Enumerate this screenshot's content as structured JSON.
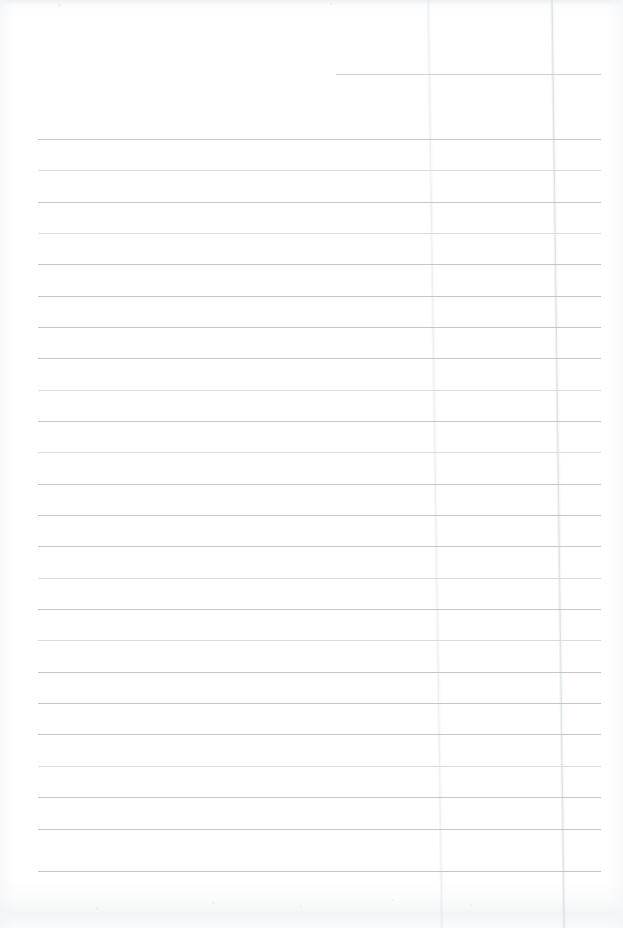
{
  "document": {
    "kind": "scanned-page",
    "description": "Blank ruled notebook page scan",
    "page_width": 623,
    "page_height": 928,
    "background_color": "#ffffff",
    "rule_color": "#b9bdc2",
    "rule_color_faint": "#d6d9dd",
    "crease_color": "#d4d9df",
    "text_content": "",
    "ruling": {
      "line_count": 24,
      "first_line_y": 139,
      "line_spacing": 31.3,
      "left_margin_x": 38,
      "right_margin_x": 600
    },
    "partial_line": {
      "y": 74,
      "x_start": 336,
      "x_end": 601
    },
    "lines": [
      {
        "y": 139,
        "x": 38,
        "width": 563,
        "faint": false
      },
      {
        "y": 170,
        "x": 38,
        "width": 563,
        "faint": true
      },
      {
        "y": 202,
        "x": 38,
        "width": 563,
        "faint": false
      },
      {
        "y": 233,
        "x": 38,
        "width": 563,
        "faint": true
      },
      {
        "y": 264,
        "x": 38,
        "width": 563,
        "faint": false
      },
      {
        "y": 296,
        "x": 38,
        "width": 563,
        "faint": false
      },
      {
        "y": 327,
        "x": 38,
        "width": 563,
        "faint": false
      },
      {
        "y": 358,
        "x": 38,
        "width": 563,
        "faint": false
      },
      {
        "y": 390,
        "x": 38,
        "width": 563,
        "faint": true
      },
      {
        "y": 421,
        "x": 38,
        "width": 563,
        "faint": false
      },
      {
        "y": 452,
        "x": 38,
        "width": 563,
        "faint": true
      },
      {
        "y": 484,
        "x": 38,
        "width": 563,
        "faint": false
      },
      {
        "y": 515,
        "x": 38,
        "width": 563,
        "faint": false
      },
      {
        "y": 546,
        "x": 38,
        "width": 563,
        "faint": false
      },
      {
        "y": 578,
        "x": 38,
        "width": 563,
        "faint": true
      },
      {
        "y": 609,
        "x": 38,
        "width": 563,
        "faint": false
      },
      {
        "y": 640,
        "x": 38,
        "width": 563,
        "faint": true
      },
      {
        "y": 672,
        "x": 38,
        "width": 563,
        "faint": false
      },
      {
        "y": 703,
        "x": 38,
        "width": 563,
        "faint": false
      },
      {
        "y": 734,
        "x": 38,
        "width": 563,
        "faint": false
      },
      {
        "y": 766,
        "x": 38,
        "width": 563,
        "faint": true
      },
      {
        "y": 797,
        "x": 38,
        "width": 563,
        "faint": false
      },
      {
        "y": 829,
        "x": 38,
        "width": 563,
        "faint": false
      },
      {
        "y": 871,
        "x": 38,
        "width": 563,
        "faint": false
      }
    ],
    "creases": [
      {
        "x": 433,
        "strength": "light"
      },
      {
        "x": 556,
        "strength": "medium"
      }
    ],
    "specks": [
      {
        "x": 212,
        "y": 901,
        "size": 3
      },
      {
        "x": 300,
        "y": 905,
        "size": 2
      },
      {
        "x": 392,
        "y": 899,
        "size": 2
      },
      {
        "x": 96,
        "y": 907,
        "size": 3
      },
      {
        "x": 470,
        "y": 904,
        "size": 2
      },
      {
        "x": 58,
        "y": 4,
        "size": 3
      },
      {
        "x": 330,
        "y": 3,
        "size": 2
      }
    ]
  }
}
